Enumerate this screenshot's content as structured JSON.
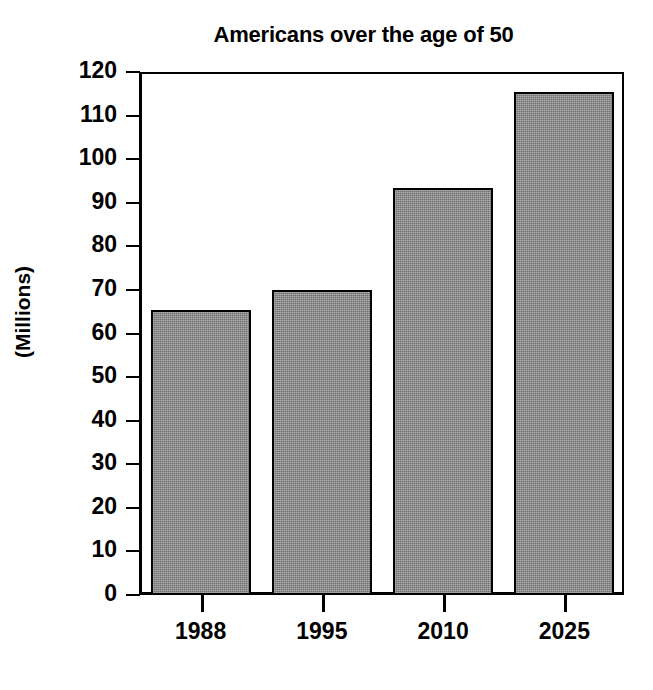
{
  "chart_data": {
    "type": "bar",
    "title": "Americans over the age of 50",
    "xlabel": "",
    "ylabel": "(Millions)",
    "categories": [
      "1988",
      "1995",
      "2010",
      "2025"
    ],
    "values": [
      65.5,
      70,
      93.5,
      115.5
    ],
    "ylim": [
      0,
      120
    ],
    "yticks": [
      0,
      10,
      20,
      30,
      40,
      50,
      60,
      70,
      80,
      90,
      100,
      110,
      120
    ],
    "ytick_labels": [
      "0",
      "10",
      "20",
      "30",
      "40",
      "50",
      "60",
      "70",
      "80",
      "90",
      "100",
      "110",
      "120"
    ],
    "grid": false,
    "legend": false,
    "legend_position": "none",
    "series": [
      {
        "name": "Americans over the age of 50",
        "values": [
          65.5,
          70,
          93.5,
          115.5
        ]
      }
    ],
    "colors": {
      "bar_fill": "#8a8a8a",
      "bar_edge": "#000000",
      "axis": "#000000",
      "background": "#ffffff",
      "text": "#000000"
    }
  }
}
